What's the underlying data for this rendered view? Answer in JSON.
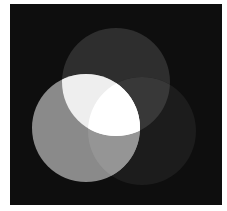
{
  "diagram": {
    "type": "venn",
    "background": "#0e0e0e",
    "canvas": {
      "x": 10,
      "y": 4,
      "width": 212,
      "height": 201
    },
    "circles": [
      {
        "id": "top",
        "cx": 116,
        "cy": 82,
        "r": 54,
        "color": "#2e2e2e"
      },
      {
        "id": "left",
        "cx": 86,
        "cy": 128,
        "r": 54,
        "color": "#8a8a8a"
      },
      {
        "id": "right",
        "cx": 142,
        "cy": 131,
        "r": 54,
        "color": "#1c1c1c"
      }
    ],
    "overlaps": {
      "top_left": "#eeeeee",
      "top_right": "#383838",
      "left_right": "#959595",
      "all": "#ffffff"
    }
  }
}
